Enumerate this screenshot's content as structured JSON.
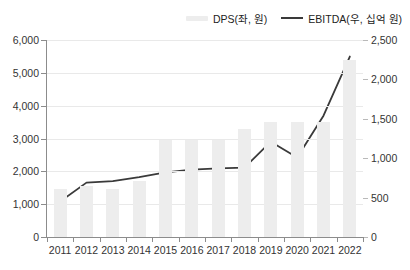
{
  "title_strip": "",
  "legend": {
    "position": "top-right",
    "items": [
      {
        "label": "DPS(좌, 원)",
        "type": "bar",
        "color": "#ededed",
        "icon": "bar-swatch-icon"
      },
      {
        "label": "EBITDA(우, 십억 원)",
        "type": "line",
        "color": "#3a3a3a",
        "icon": "line-swatch-icon"
      }
    ]
  },
  "chart_data": {
    "type": "bar",
    "title": "",
    "xlabel": "",
    "categories": [
      "2011",
      "2012",
      "2013",
      "2014",
      "2015",
      "2016",
      "2017",
      "2018",
      "2019",
      "2020",
      "2021",
      "2022"
    ],
    "grid": true,
    "axes": {
      "left": {
        "label": "DPS(좌, 원)",
        "ylim": [
          0,
          6000
        ],
        "ticks": [
          0,
          1000,
          2000,
          3000,
          4000,
          5000,
          6000
        ],
        "tick_labels": [
          "0",
          "1,000",
          "2,000",
          "3,000",
          "4,000",
          "5,000",
          "6,000"
        ]
      },
      "right": {
        "label": "EBITDA(우, 십억 원)",
        "ylim": [
          0,
          2500
        ],
        "ticks": [
          0,
          500,
          1000,
          1500,
          2000,
          2500
        ],
        "tick_labels": [
          "0",
          "500",
          "1,000",
          "1,500",
          "2,000",
          "2,500"
        ]
      }
    },
    "series": [
      {
        "name": "DPS(좌, 원)",
        "type": "bar",
        "axis": "left",
        "color": "#ededed",
        "values": [
          1450,
          1550,
          1450,
          1700,
          2950,
          2950,
          2950,
          3300,
          3500,
          3500,
          3500,
          5400
        ]
      },
      {
        "name": "EBITDA(우, 십억 원)",
        "type": "line",
        "axis": "right",
        "color": "#3a3a3a",
        "values": [
          450,
          690,
          710,
          760,
          820,
          855,
          870,
          880,
          1210,
          1010,
          1540,
          2290
        ]
      }
    ]
  }
}
